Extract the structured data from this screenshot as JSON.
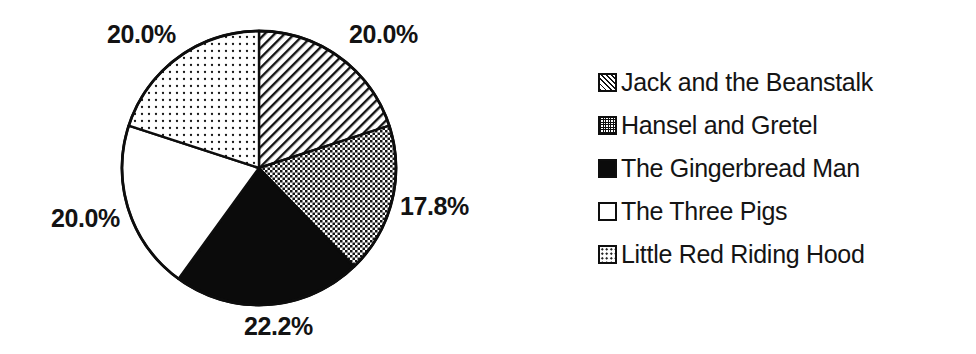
{
  "chart_data": {
    "type": "pie",
    "title": "",
    "subtitle": "",
    "xlabel": "",
    "ylabel": "",
    "legend_position": "right",
    "grid": false,
    "start_angle_deg": 0,
    "direction": "clockwise",
    "categories": [
      "Jack and the Beanstalk",
      "Hansel and Gretel",
      "The Gingerbread Man",
      "The Three Pigs",
      "Little Red Riding Hood"
    ],
    "values": [
      20.0,
      17.8,
      22.2,
      20.0,
      20.0
    ],
    "value_labels": [
      "20.0%",
      "17.8%",
      "22.2%",
      "20.0%",
      "20.0%"
    ],
    "units": "percent",
    "total": 100.0,
    "slices": [
      {
        "label": "Jack and the Beanstalk",
        "value": 20.0,
        "display": "20.0%",
        "pattern": "diagonal-hatch",
        "color": "#000000",
        "start_deg": 0.0,
        "end_deg": 72.0
      },
      {
        "label": "Hansel and Gretel",
        "value": 17.8,
        "display": "17.8%",
        "pattern": "checkerboard",
        "color": "#000000",
        "start_deg": 72.0,
        "end_deg": 136.08
      },
      {
        "label": "The Gingerbread Man",
        "value": 22.2,
        "display": "22.2%",
        "pattern": "solid",
        "color": "#000000",
        "start_deg": 136.08,
        "end_deg": 215.92
      },
      {
        "label": "The Three Pigs",
        "value": 20.0,
        "display": "20.0%",
        "pattern": "none",
        "color": "#ffffff",
        "start_deg": 215.92,
        "end_deg": 287.92
      },
      {
        "label": "Little Red Riding Hood",
        "value": 20.0,
        "display": "20.0%",
        "pattern": "dots",
        "color": "#000000",
        "start_deg": 287.92,
        "end_deg": 360.0
      }
    ]
  },
  "pie_labels": {
    "top_left": "20.0%",
    "top_right": "20.0%",
    "right": "17.8%",
    "bottom": "22.2%",
    "left": "20.0%"
  },
  "legend": {
    "items": [
      {
        "label": "Jack and the Beanstalk",
        "swatch": "diagonal-hatch-swatch"
      },
      {
        "label": "Hansel and Gretel",
        "swatch": "checkerboard-swatch"
      },
      {
        "label": "The Gingerbread Man",
        "swatch": "solid-black-swatch"
      },
      {
        "label": "The Three Pigs",
        "swatch": "white-swatch"
      },
      {
        "label": "Little Red Riding Hood",
        "swatch": "dotted-swatch"
      }
    ]
  },
  "style": {
    "background": "#ffffff",
    "ink": "#111111",
    "outline": "#0d0d0d"
  }
}
